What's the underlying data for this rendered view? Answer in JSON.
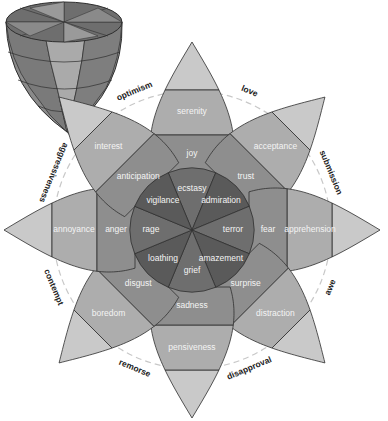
{
  "diagram": {
    "center": [
      192,
      230
    ],
    "colors": {
      "outer_tip": "#c9c9c9",
      "mild": "#adadad",
      "basic": "#8e8e8e",
      "intense": "#6e6e6e",
      "core_dark": "#5a5a5a",
      "stroke": "#2e2e2e",
      "dashed_circle": "#c8c8c8"
    },
    "petals": [
      {
        "angle": -90,
        "intense": "ecstasy",
        "basic": "joy",
        "mild": "serenity"
      },
      {
        "angle": -45,
        "intense": "admiration",
        "basic": "trust",
        "mild": "acceptance"
      },
      {
        "angle": 0,
        "intense": "terror",
        "basic": "fear",
        "mild": "apprehension"
      },
      {
        "angle": 45,
        "intense": "amazement",
        "basic": "surprise",
        "mild": "distraction"
      },
      {
        "angle": 90,
        "intense": "grief",
        "basic": "sadness",
        "mild": "pensiveness"
      },
      {
        "angle": 135,
        "intense": "loathing",
        "basic": "disgust",
        "mild": "boredom"
      },
      {
        "angle": 180,
        "intense": "rage",
        "basic": "anger",
        "mild": "annoyance"
      },
      {
        "angle": 225,
        "intense": "vigilance",
        "basic": "anticipation",
        "mild": "interest"
      }
    ],
    "dyads": [
      {
        "label": "optimism",
        "angle": -112.5
      },
      {
        "label": "love",
        "angle": -67.5
      },
      {
        "label": "submission",
        "angle": -22.5
      },
      {
        "label": "awe",
        "angle": 22.5
      },
      {
        "label": "disapproval",
        "angle": 67.5
      },
      {
        "label": "remorse",
        "angle": 112.5
      },
      {
        "label": "contempt",
        "angle": 157.5
      },
      {
        "label": "aggressiveness",
        "angle": 202.5
      }
    ]
  }
}
